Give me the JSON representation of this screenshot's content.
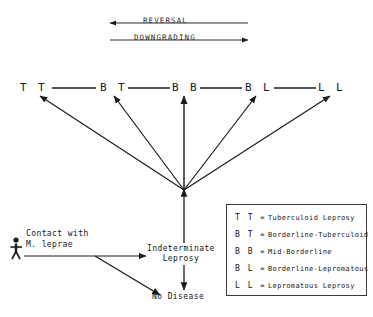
{
  "diagram": {
    "flow_arrows": [
      {
        "label": "REVERSAL",
        "direction": "left"
      },
      {
        "label": "DOWNGRADING",
        "direction": "right"
      }
    ],
    "spectrum": [
      {
        "code": "T T"
      },
      {
        "code": "B T"
      },
      {
        "code": "B B"
      },
      {
        "code": "B L"
      },
      {
        "code": "L L"
      }
    ],
    "nodes": {
      "contact": "Contact with\nM. leprae",
      "indeterminate": "Indeterminate\nLeprosy",
      "no_disease": "No Disease"
    },
    "legend": [
      {
        "code": "T T",
        "eq": "=",
        "text": "Tuberculoid Leprosy"
      },
      {
        "code": "B T",
        "eq": "=",
        "text": "Borderline-Tuberculoid"
      },
      {
        "code": "B B",
        "eq": "=",
        "text": "Mid-Borderline"
      },
      {
        "code": "B L",
        "eq": "=",
        "text": "Borderline-Lepromatous"
      },
      {
        "code": "L L",
        "eq": "=",
        "text": "Lepromatous Leprosy"
      }
    ],
    "colors": {
      "ink": "#1a1a1a",
      "paper": "#ffffff"
    }
  }
}
